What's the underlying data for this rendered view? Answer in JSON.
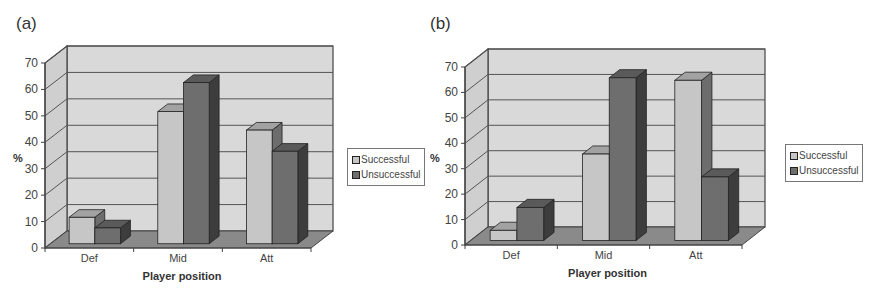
{
  "panels": [
    {
      "label": "(a)"
    },
    {
      "label": "(b)"
    }
  ],
  "colors": {
    "successful": "#c6c6c6",
    "unsuccessful": "#6e6e6e",
    "wall": "#d9d9d9",
    "floor": "#8a8a8a"
  },
  "chart_data": [
    {
      "type": "bar",
      "title": "(a)",
      "xlabel": "Player position",
      "ylabel": "%",
      "categories": [
        "Def",
        "Mid",
        "Att"
      ],
      "series": [
        {
          "name": "Successful",
          "values": [
            10,
            50,
            43
          ]
        },
        {
          "name": "Unsuccessful",
          "values": [
            6,
            61,
            35
          ]
        }
      ],
      "ylim": [
        0,
        70
      ],
      "yticks": [
        "0",
        "10",
        "20",
        "30",
        "40",
        "50",
        "60",
        "70"
      ],
      "grid": true,
      "legend_position": "right",
      "style": "3d-clustered-column"
    },
    {
      "type": "bar",
      "title": "(b)",
      "xlabel": "Player position",
      "ylabel": "%",
      "categories": [
        "Def",
        "Mid",
        "Att"
      ],
      "series": [
        {
          "name": "Successful",
          "values": [
            4,
            34,
            63
          ]
        },
        {
          "name": "Unsuccessful",
          "values": [
            13,
            64,
            25
          ]
        }
      ],
      "ylim": [
        0,
        70
      ],
      "yticks": [
        "0",
        "10",
        "20",
        "30",
        "40",
        "50",
        "60",
        "70"
      ],
      "grid": true,
      "legend_position": "right",
      "style": "3d-clustered-column"
    }
  ]
}
